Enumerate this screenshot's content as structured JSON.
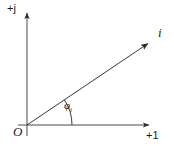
{
  "figure": {
    "kind": "phasor-diagram",
    "background_color": "#ffffff",
    "stroke_color": "#3a3a3a",
    "text_color": "#1a1a1a",
    "width": 174,
    "height": 150
  },
  "axes": {
    "imaginary": {
      "label": "+j",
      "name": "imaginary-axis",
      "x": 27,
      "y_top": 11,
      "y_bottom": 136
    },
    "real": {
      "label": "+1",
      "name": "real-axis",
      "y": 125,
      "x_left": 18,
      "x_right": 151
    },
    "origin": {
      "label": "O",
      "x": 27,
      "y": 125
    }
  },
  "vector": {
    "label": "i",
    "name": "current-phasor",
    "start_x": 27,
    "start_y": 125,
    "end_x": 150,
    "end_y": 42,
    "angle_degrees": 34
  },
  "angle": {
    "symbol": "φ",
    "subscript": "i",
    "arc_radius": 45,
    "start_degrees": 0,
    "end_degrees": 34
  }
}
